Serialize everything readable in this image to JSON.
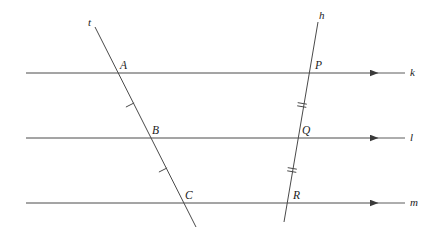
{
  "figure": {
    "background_color": "#ffffff",
    "stroke_color": "#4a4a4a",
    "label_color": "#1c1c1c",
    "width": 438,
    "height": 236
  },
  "parallel_lines": [
    {
      "name": "k",
      "label": "k",
      "y": 73,
      "x_start": 26,
      "x_end": 405,
      "arrow_x": 378,
      "label_x": 410,
      "label_y": 67
    },
    {
      "name": "l",
      "label": "l",
      "y": 138,
      "x_start": 26,
      "x_end": 405,
      "arrow_x": 378,
      "label_x": 410,
      "label_y": 132
    },
    {
      "name": "m",
      "label": "m",
      "y": 203,
      "x_start": 26,
      "x_end": 405,
      "arrow_x": 378,
      "label_x": 410,
      "label_y": 197
    }
  ],
  "transversals": [
    {
      "name": "t",
      "label": "t",
      "x1": 95,
      "y1": 27,
      "x2": 196,
      "y2": 227,
      "label_x": 88,
      "label_y": 17
    },
    {
      "name": "h",
      "label": "h",
      "x1": 318,
      "y1": 22,
      "x2": 284,
      "y2": 222,
      "label_x": 319,
      "label_y": 10
    }
  ],
  "points": [
    {
      "label": "A",
      "x": 114,
      "y": 73,
      "label_x": 120,
      "label_y": 60,
      "on_lines": [
        "t",
        "k"
      ]
    },
    {
      "label": "B",
      "x": 147,
      "y": 138,
      "label_x": 152,
      "label_y": 125,
      "on_lines": [
        "t",
        "l"
      ]
    },
    {
      "label": "C",
      "x": 180,
      "y": 203,
      "label_x": 185,
      "label_y": 190,
      "on_lines": [
        "t",
        "m"
      ]
    },
    {
      "label": "P",
      "x": 307,
      "y": 73,
      "label_x": 315,
      "label_y": 60,
      "on_lines": [
        "h",
        "k"
      ]
    },
    {
      "label": "Q",
      "x": 296,
      "y": 138,
      "label_x": 302,
      "label_y": 125,
      "on_lines": [
        "h",
        "l"
      ]
    },
    {
      "label": "R",
      "x": 288,
      "y": 203,
      "label_x": 293,
      "label_y": 190,
      "on_lines": [
        "h",
        "m"
      ]
    }
  ],
  "congruence_marks": [
    {
      "segment": "AB",
      "ticks": 1,
      "x": 130,
      "y": 105
    },
    {
      "segment": "BC",
      "ticks": 1,
      "x": 163,
      "y": 170
    },
    {
      "segment": "PQ",
      "ticks": 2,
      "x": 302,
      "y": 105
    },
    {
      "segment": "QR",
      "ticks": 2,
      "x": 292,
      "y": 170
    }
  ]
}
